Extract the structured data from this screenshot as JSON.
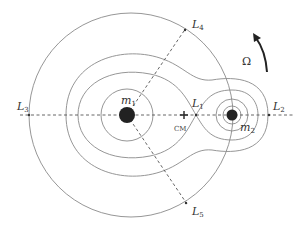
{
  "diagram": {
    "masses": [
      {
        "label": "m",
        "sub": "1",
        "role": "primary"
      },
      {
        "label": "m",
        "sub": "2",
        "role": "secondary"
      }
    ],
    "center_of_mass_label": "CM",
    "lagrange_points": [
      {
        "label": "L",
        "sub": "1"
      },
      {
        "label": "L",
        "sub": "2"
      },
      {
        "label": "L",
        "sub": "3"
      },
      {
        "label": "L",
        "sub": "4"
      },
      {
        "label": "L",
        "sub": "5"
      }
    ],
    "rotation_label": "Ω",
    "colors": {
      "contour": "#8a8a8a",
      "mass": "#222222",
      "axis": "#555555",
      "text": "#333333"
    }
  }
}
